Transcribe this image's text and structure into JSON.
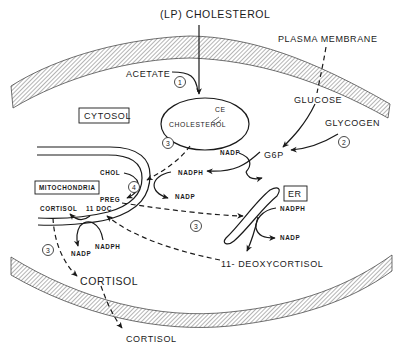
{
  "figure": {
    "inputs": {
      "lp_cholesterol": "(LP) CHOLESTEROL",
      "acetate": "ACETATE",
      "glucose": "GLUCOSE",
      "glycogen": "GLYCOGEN"
    },
    "compartments": {
      "plasma_membrane": "PLASMA MEMBRANE",
      "cytosol": "CYTOSOL",
      "mitochondria": "MITOCHONDRIA",
      "er": "ER"
    },
    "metabolites": {
      "cholesterol": "CHOLESTEROL",
      "ce": "CE",
      "g6p": "G6P",
      "chol": "CHOL",
      "preg": "PREG",
      "cortisol_mito": "CORTISOL",
      "doc": "11 DOC",
      "deoxycortisol": "11- DEOXYCORTISOL",
      "cortisol_cytosol": "CORTISOL",
      "cortisol_out": "CORTISOL"
    },
    "cofactors": {
      "nadp_g6p": "NADP",
      "nadph_g6p": "NADPH",
      "nadp_mito_scc": "NADP",
      "nadph_er": "NADPH",
      "nadp_er": "NADP",
      "nadph_mito_11b": "NADPH",
      "nadp_mito_11b": "NADP"
    },
    "steps": {
      "step1": "1",
      "step2": "2",
      "step3a": "3",
      "step3b": "3",
      "step3c": "3",
      "step4": "4"
    }
  }
}
